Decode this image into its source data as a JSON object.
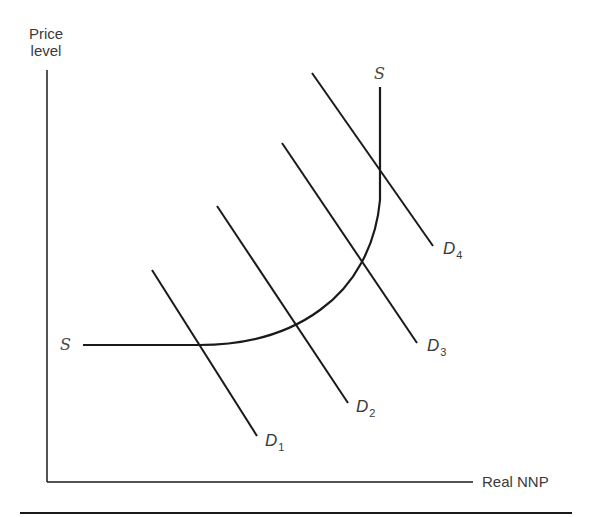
{
  "figure": {
    "type": "aggregate supply / aggregate demand diagram",
    "y_axis_label_line1": "Price",
    "y_axis_label_line2": "level",
    "x_axis_label": "Real NNP",
    "supply_curve": {
      "name": "S",
      "label_left": "S",
      "label_top": "S",
      "segments": [
        "horizontal range",
        "intermediate range",
        "vertical range"
      ]
    },
    "demand_curves": [
      {
        "name": "D1",
        "letter": "D",
        "subscript": "1"
      },
      {
        "name": "D2",
        "letter": "D",
        "subscript": "2"
      },
      {
        "name": "D3",
        "letter": "D",
        "subscript": "3"
      },
      {
        "name": "D4",
        "letter": "D",
        "subscript": "4"
      }
    ],
    "colors": {
      "line": "#1a1a1a",
      "text": "#3a3a3a",
      "background": "#ffffff"
    }
  }
}
